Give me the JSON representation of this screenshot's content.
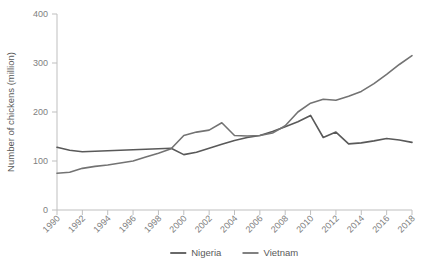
{
  "chart_data": {
    "type": "line",
    "title": "",
    "subtitle": "",
    "xlabel": "",
    "ylabel": "Number of chickens (million)",
    "xlim": [
      1990,
      2018
    ],
    "ylim": [
      0,
      400
    ],
    "yticks": [
      0,
      100,
      200,
      300,
      400
    ],
    "ytick_labels": [
      "0",
      "100",
      "200",
      "300",
      "400"
    ],
    "xticks": [
      1990,
      1992,
      1994,
      1996,
      1998,
      2000,
      2002,
      2004,
      2006,
      2008,
      2010,
      2012,
      2014,
      2016,
      2018
    ],
    "xtick_labels": [
      "1990",
      "1992",
      "1994",
      "1996",
      "1998",
      "2000",
      "2002",
      "2004",
      "2006",
      "2008",
      "2010",
      "2012",
      "2014",
      "2016",
      "2018"
    ],
    "grid": false,
    "legend_position": "bottom",
    "x": [
      1990,
      1991,
      1992,
      1993,
      1994,
      1995,
      1996,
      1997,
      1998,
      1999,
      2000,
      2001,
      2002,
      2003,
      2004,
      2005,
      2006,
      2007,
      2008,
      2009,
      2010,
      2011,
      2012,
      2013,
      2014,
      2015,
      2016,
      2017,
      2018
    ],
    "series": [
      {
        "name": "Nigeria",
        "color": "#595959",
        "values": [
          128,
          122,
          119,
          120,
          121,
          122,
          123,
          124,
          125,
          126,
          113,
          118,
          126,
          134,
          142,
          148,
          152,
          160,
          170,
          180,
          193,
          148,
          159,
          135,
          137,
          141,
          146,
          143,
          138
        ]
      },
      {
        "name": "Vietnam",
        "color": "#737373",
        "values": [
          75,
          77,
          85,
          89,
          92,
          96,
          100,
          108,
          116,
          125,
          152,
          159,
          163,
          178,
          152,
          151,
          152,
          157,
          172,
          200,
          218,
          226,
          224,
          232,
          242,
          258,
          277,
          297,
          315
        ]
      }
    ]
  },
  "legend": {
    "items": [
      {
        "label": "Nigeria",
        "color": "#595959"
      },
      {
        "label": "Vietnam",
        "color": "#737373"
      }
    ]
  }
}
